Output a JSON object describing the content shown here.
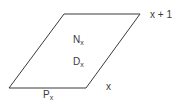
{
  "diagram": {
    "type": "parallelogram",
    "stroke_color": "#3a3a3a",
    "background": "#ffffff",
    "vertices": {
      "top_left": [
        64,
        14
      ],
      "top_right": [
        140,
        14
      ],
      "bottom_right": [
        86,
        88
      ],
      "bottom_left": [
        9,
        88
      ]
    },
    "labels": {
      "upper_line": "x + 1",
      "lower_line": "x",
      "inside_upper": {
        "main": "N",
        "sub": "x"
      },
      "inside_lower": {
        "main": "D",
        "sub": "x"
      },
      "bottom_edge": {
        "main": "P",
        "sub": "x"
      }
    }
  }
}
